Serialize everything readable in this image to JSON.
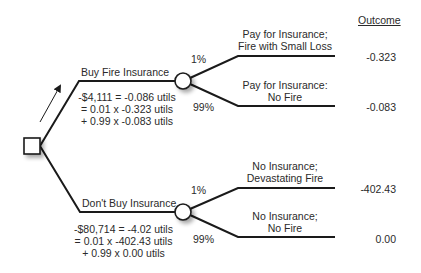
{
  "header": {
    "outcome_label": "Outcome"
  },
  "decisions": [
    {
      "label": "Buy Fire Insurance",
      "calc": [
        "-$4,111 = -0.086 utils",
        "= 0.01 x -0.323 utils",
        "+ 0.99 x -0.083 utils"
      ],
      "branches": [
        {
          "prob": "1%",
          "label": [
            "Pay for Insurance;",
            "Fire with Small Loss"
          ],
          "outcome": "-0.323"
        },
        {
          "prob": "99%",
          "label": [
            "Pay for Insurance:",
            "No Fire"
          ],
          "outcome": "-0.083"
        }
      ]
    },
    {
      "label": "Don't Buy Insurance",
      "calc": [
        "-$80,714 = -4.02 utils",
        "= 0.01 x -402.43 utils",
        "+ 0.99 x 0.00 utils"
      ],
      "branches": [
        {
          "prob": "1%",
          "label": [
            "No Insurance;",
            "Devastating Fire"
          ],
          "outcome": "-402.43"
        },
        {
          "prob": "99%",
          "label": [
            "No Insurance;",
            "No Fire"
          ],
          "outcome": "0.00"
        }
      ]
    }
  ],
  "colors": {
    "line": "#1a1a1a",
    "text": "#2a2a2a",
    "background": "#ffffff"
  }
}
